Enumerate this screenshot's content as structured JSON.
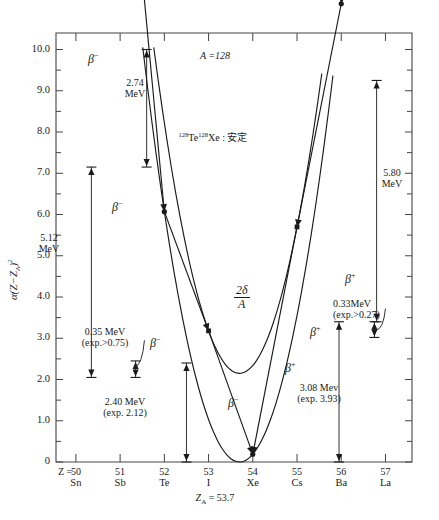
{
  "header": {
    "faint_text": ""
  },
  "axes": {
    "y_label": "α(Z−Z_A)²",
    "y_ticks": [
      "10.0",
      "9.0",
      "8.0",
      "7.0",
      "6.0",
      "5.0",
      "4.0",
      "3.0",
      "2.0",
      "1.0",
      "0"
    ],
    "y_min": 0,
    "y_max": 10.4,
    "x_prefix": "Z =",
    "x_numbers": [
      "50",
      "51",
      "52",
      "53",
      "54",
      "55",
      "56",
      "57"
    ],
    "x_symbols": [
      "Sn",
      "Sb",
      "Te",
      "I",
      "Xe",
      "Cs",
      "Ba",
      "La"
    ],
    "za_label": "Z_A = 53.7",
    "za_value": 53.7
  },
  "annotations": {
    "mass_number": "A =128",
    "stable": "128Te 128Xe : 安定",
    "stable_parts": {
      "a": "128",
      "b": "Te",
      "c": "128",
      "d": "Xe",
      "e": " : 安定"
    },
    "delta": {
      "num": "2δ",
      "den": "A"
    },
    "e274": {
      "value": "2.74",
      "unit": "MeV"
    },
    "e512": {
      "value": "5.12",
      "unit": "MeV"
    },
    "e580": {
      "value": "5.80",
      "unit": "MeV"
    },
    "e035": {
      "value": "0.35 MeV",
      "exp": "(exp.>0.75)"
    },
    "e240": {
      "value": "2.40 MeV",
      "exp": "(exp. 2.12)"
    },
    "e033": {
      "value": "0.33MeV",
      "exp": "(exp.>0.27)"
    },
    "e308": {
      "value": "3.08 Mev",
      "exp": "(exp. 3.93)"
    },
    "beta_minus": "β−",
    "beta_plus": "β+"
  },
  "chart_data": {
    "type": "line",
    "xlabel": "Z",
    "ylabel": "α(Z−Z_A)²",
    "xlim": [
      49.55,
      57.6
    ],
    "ylim": [
      0,
      10.4
    ],
    "grid": false,
    "legend": "none",
    "za": 53.7,
    "alpha": 2.1,
    "two_delta_over_A": 2.15,
    "series": [
      {
        "name": "odd-odd parabola (upper)",
        "parity": "odd-odd",
        "x": [
          50.0,
          51.0,
          52.0,
          53.0,
          54.0,
          55.0,
          56.0,
          57.0
        ],
        "y": [
          10.0,
          7.15,
          4.45,
          2.95,
          2.25,
          3.35,
          5.55,
          9.25
        ],
        "points_marked": [
          {
            "x": 51,
            "y": 7.15,
            "nuclide": "Sb"
          },
          {
            "x": 53,
            "y": 2.95,
            "nuclide": "I"
          },
          {
            "x": 55,
            "y": 3.35,
            "nuclide": "Cs"
          }
        ]
      },
      {
        "name": "even-even parabola (lower)",
        "parity": "even-even",
        "x": [
          50.0,
          51.0,
          52.0,
          53.0,
          54.0,
          55.0,
          56.0,
          57.0
        ],
        "y": [
          10.0,
          7.15,
          2.15,
          0.6,
          0.0,
          0.95,
          3.4,
          9.25
        ],
        "points_marked": [
          {
            "x": 50,
            "y": 10.0,
            "nuclide": "Sn"
          },
          {
            "x": 52,
            "y": 2.15,
            "nuclide": "Te"
          },
          {
            "x": 54,
            "y": 0.0,
            "nuclide": "Xe"
          },
          {
            "x": 56,
            "y": 3.4,
            "nuclide": "Ba"
          },
          {
            "x": 57,
            "y": 9.25,
            "nuclide": "La"
          }
        ]
      }
    ],
    "transitions": [
      {
        "from": 51,
        "to": 52,
        "type": "β−",
        "energy_MeV": 5.12,
        "label": "5.12 MeV"
      },
      {
        "from": 53,
        "to": 54,
        "type": "β−",
        "energy_MeV": 2.4,
        "label": "2.40 MeV",
        "exp": 2.12
      },
      {
        "from": 52,
        "to": 53,
        "type": "β−",
        "energy_MeV": 0.35,
        "label": "0.35 MeV",
        "exp": 0.75
      },
      {
        "from": 55,
        "to": 54,
        "type": "β+",
        "energy_MeV": 3.08,
        "label": "3.08 Mev",
        "exp": 3.93
      },
      {
        "from": 56,
        "to": 55,
        "type": "β+",
        "energy_MeV": 0.33,
        "label": "0.33MeV",
        "exp": 0.27
      },
      {
        "from": 50,
        "to": 51,
        "type": "β−",
        "energy_MeV": 2.74,
        "label": "2.74 MeV"
      },
      {
        "from": 57,
        "to": 56,
        "type": "β+",
        "energy_MeV": 5.8,
        "label": "5.80 MeV"
      }
    ],
    "measure_bars": [
      {
        "label": "2.74 MeV",
        "y_top": 10.0,
        "y_bottom": 7.15,
        "x": 51.6
      },
      {
        "label": "5.12 MeV",
        "y_top": 7.15,
        "y_bottom": 2.05,
        "x": 50.35
      },
      {
        "label": "0.35 MeV",
        "y_top": 2.45,
        "y_bottom": 2.05,
        "x": 51.35
      },
      {
        "label": "2.40 MeV",
        "y_top": 2.4,
        "y_bottom": 0.0,
        "x": 52.5
      },
      {
        "label": "3.08 Mev",
        "y_top": 3.4,
        "y_bottom": 0.0,
        "x": 55.95
      },
      {
        "label": "0.33MeV",
        "y_top": 3.4,
        "y_bottom": 3.02,
        "x": 56.75
      },
      {
        "label": "5.80 MeV",
        "y_top": 9.25,
        "y_bottom": 3.4,
        "x": 56.8
      }
    ]
  }
}
